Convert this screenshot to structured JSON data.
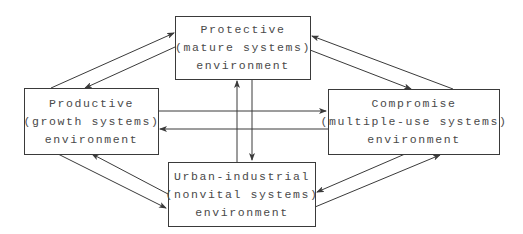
{
  "diagram": {
    "nodes": {
      "protective": {
        "line1": "Protective",
        "line2": "(mature systems)",
        "line3": "environment"
      },
      "productive": {
        "line1": "Productive",
        "line2": "(growth systems)",
        "line3": "environment"
      },
      "compromise": {
        "line1": "Compromise",
        "line2": "(multiple-use systems)",
        "line3": "environment"
      },
      "urban": {
        "line1": "Urban-industrial",
        "line2": "(nonvital systems)",
        "line3": "environment"
      }
    },
    "edges": [
      {
        "from": "productive",
        "to": "protective"
      },
      {
        "from": "protective",
        "to": "productive"
      },
      {
        "from": "protective",
        "to": "compromise"
      },
      {
        "from": "compromise",
        "to": "protective"
      },
      {
        "from": "productive",
        "to": "compromise"
      },
      {
        "from": "compromise",
        "to": "productive"
      },
      {
        "from": "urban",
        "to": "protective"
      },
      {
        "from": "protective",
        "to": "urban"
      },
      {
        "from": "productive",
        "to": "urban"
      },
      {
        "from": "urban",
        "to": "productive"
      },
      {
        "from": "urban",
        "to": "compromise"
      },
      {
        "from": "compromise",
        "to": "urban"
      }
    ],
    "colors": {
      "line": "#3a3a3a",
      "text": "#4a4a4a",
      "background": "#ffffff"
    }
  }
}
